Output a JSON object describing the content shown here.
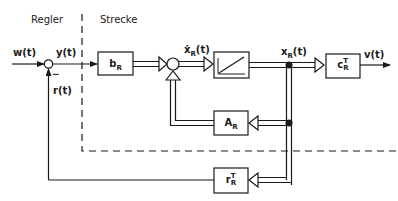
{
  "regions": {
    "controller": "Regler",
    "plant": "Strecke"
  },
  "signals": {
    "w": "w(t)",
    "y": "y(t)",
    "r": "r(t)",
    "xdot": "ẋ",
    "xdot_sub": "R",
    "xdot_arg": "(t)",
    "x": "x",
    "x_sub": "R",
    "x_arg": "(t)",
    "v": "v(t)",
    "minus_sign": "−"
  },
  "blocks": {
    "input_matrix": {
      "main": "b",
      "sub": "R"
    },
    "integrator": {
      "symbol": "ramp"
    },
    "system_matrix": {
      "main": "A",
      "sub": "R"
    },
    "output_matrix": {
      "main": "c",
      "sup": "T",
      "sub": "R"
    },
    "feedback_matrix": {
      "main": "r",
      "sup": "T",
      "sub": "R"
    }
  },
  "colors": {
    "stroke": "#1a1a1a",
    "background": "#ffffff"
  }
}
